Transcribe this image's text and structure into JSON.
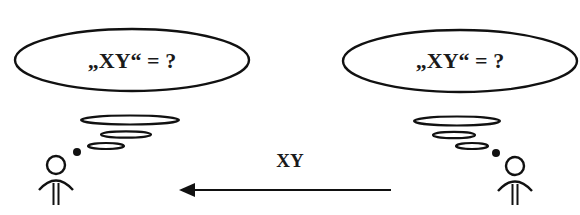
{
  "diagram": {
    "left_person": {
      "thought_bubble_text": "„XY“ = ?",
      "role": "receiver"
    },
    "right_person": {
      "thought_bubble_text": "„XY“ = ?",
      "role": "sender"
    },
    "message": {
      "label": "XY",
      "direction": "right-to-left"
    },
    "icons": {
      "person": "person-icon",
      "thought": "thought-bubble-icon",
      "arrow": "arrow-left-icon"
    },
    "colors": {
      "ink": "#111111",
      "background": "#ffffff"
    }
  }
}
